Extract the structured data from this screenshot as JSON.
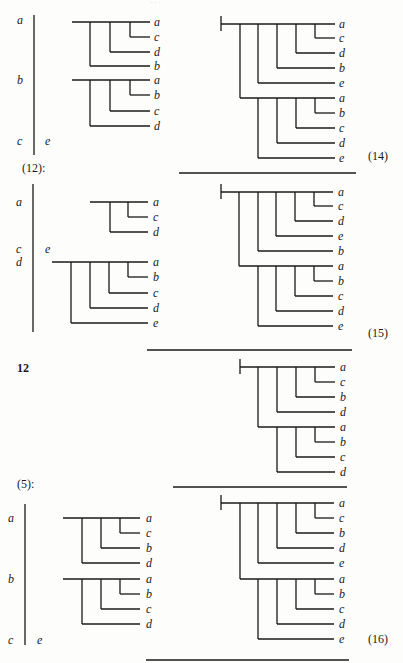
{
  "page": {
    "running_header": "...",
    "blocks": [
      {
        "id": "block-1",
        "left_column_labels": [
          "a",
          "b",
          "c"
        ],
        "left_extra_label": "e",
        "left_trees": [
          {
            "leaves": [
              "a",
              "c",
              "d",
              "b"
            ]
          },
          {
            "leaves": [
              "a",
              "b",
              "c",
              "d"
            ]
          }
        ],
        "right_tree": {
          "leaves": [
            "a",
            "c",
            "d",
            "b",
            "e",
            "a",
            "b",
            "c",
            "d",
            "e"
          ]
        },
        "equation_number": "(14)"
      },
      {
        "id": "block-2",
        "intro_label": "(12):",
        "left_column_labels": [
          "a",
          "c",
          "d"
        ],
        "left_extra_label": "e",
        "left_trees": [
          {
            "leaves": [
              "a",
              "c",
              "d"
            ]
          },
          {
            "leaves": [
              "a",
              "b",
              "c",
              "d",
              "e"
            ]
          }
        ],
        "right_tree": {
          "leaves": [
            "a",
            "c",
            "d",
            "e",
            "b",
            "a",
            "b",
            "c",
            "d",
            "e"
          ]
        },
        "equation_number": "(15)"
      },
      {
        "id": "block-3",
        "intro_label": "12",
        "right_tree": {
          "leaves": [
            "a",
            "c",
            "b",
            "d",
            "a",
            "b",
            "c",
            "d"
          ]
        }
      },
      {
        "id": "block-4",
        "intro_label": "(5):",
        "left_column_labels": [
          "a",
          "b",
          "c"
        ],
        "left_extra_label": "e",
        "left_trees": [
          {
            "leaves": [
              "a",
              "c",
              "b",
              "d"
            ]
          },
          {
            "leaves": [
              "a",
              "b",
              "c",
              "d"
            ]
          }
        ],
        "right_tree": {
          "leaves": [
            "a",
            "c",
            "b",
            "d",
            "e",
            "a",
            "b",
            "c",
            "d",
            "e"
          ]
        },
        "equation_number": "(16)"
      }
    ]
  }
}
